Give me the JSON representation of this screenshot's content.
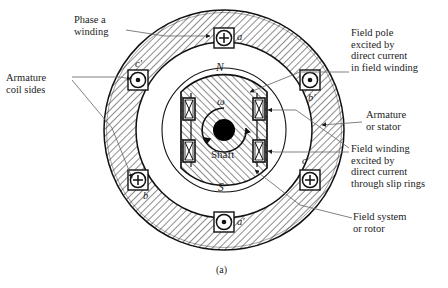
{
  "figure": {
    "caption": "(a)",
    "colors": {
      "ink": "#1a1a1a",
      "hatch": "#2b2b2b",
      "shaft": "#000000",
      "background": "#ffffff"
    }
  },
  "callouts": [
    {
      "id": "phase-a-winding",
      "text": "Phase a\nwinding",
      "x": 74,
      "y": 14,
      "align": "left"
    },
    {
      "id": "armature-coil-sides",
      "text": "Armature\ncoil sides",
      "x": 6,
      "y": 72,
      "align": "left"
    },
    {
      "id": "field-pole-excited",
      "text": "Field pole\nexcited by\ndirect current\nin field winding",
      "x": 351,
      "y": 27,
      "align": "left"
    },
    {
      "id": "armature-or-stator",
      "text": "Armature\nor stator",
      "x": 366,
      "y": 109,
      "align": "left"
    },
    {
      "id": "field-winding-excited",
      "text": "Field winding\nexcited by\ndirect current\nthrough slip rings",
      "x": 351,
      "y": 143,
      "align": "left"
    },
    {
      "id": "field-system-or-rotor",
      "text": "Field system\nor rotor",
      "x": 353,
      "y": 211,
      "align": "left"
    }
  ],
  "inner_labels": {
    "north_pole": "N",
    "south_pole": "S",
    "omega": "ω",
    "shaft": "Shaft"
  },
  "coil_sides": [
    {
      "name": "a",
      "symbol": "plus",
      "symbol_glyph": "+",
      "meaning": "current into page",
      "angle_deg": 90,
      "label_side": "right"
    },
    {
      "name": "c′",
      "symbol": "dot",
      "symbol_glyph": "·",
      "meaning": "current out of page",
      "angle_deg": 150,
      "label_side": "upper-right"
    },
    {
      "name": "b",
      "symbol": "plus",
      "symbol_glyph": "+",
      "meaning": "current into page",
      "angle_deg": 210,
      "label_side": "lower-right"
    },
    {
      "name": "a′",
      "symbol": "dot",
      "symbol_glyph": "·",
      "meaning": "current out of page",
      "angle_deg": 270,
      "label_side": "right"
    },
    {
      "name": "c",
      "symbol": "plus",
      "symbol_glyph": "+",
      "meaning": "current into page",
      "angle_deg": 330,
      "label_side": "upper-left"
    },
    {
      "name": "b′",
      "symbol": "dot",
      "symbol_glyph": "·",
      "meaning": "current out of page",
      "angle_deg": 30,
      "label_side": "lower-left"
    }
  ],
  "field_coils": [
    {
      "id": "field-coil-left-upper",
      "glyph": "X"
    },
    {
      "id": "field-coil-left-lower",
      "glyph": "X"
    },
    {
      "id": "field-coil-right-upper",
      "glyph": "X"
    },
    {
      "id": "field-coil-right-lower",
      "glyph": "X"
    }
  ],
  "geometry": {
    "center_x": 224,
    "center_y": 130,
    "stator_outer_radius": 120,
    "stator_inner_radius": 88,
    "rotor_radius": 62,
    "shaft_radius": 11
  }
}
